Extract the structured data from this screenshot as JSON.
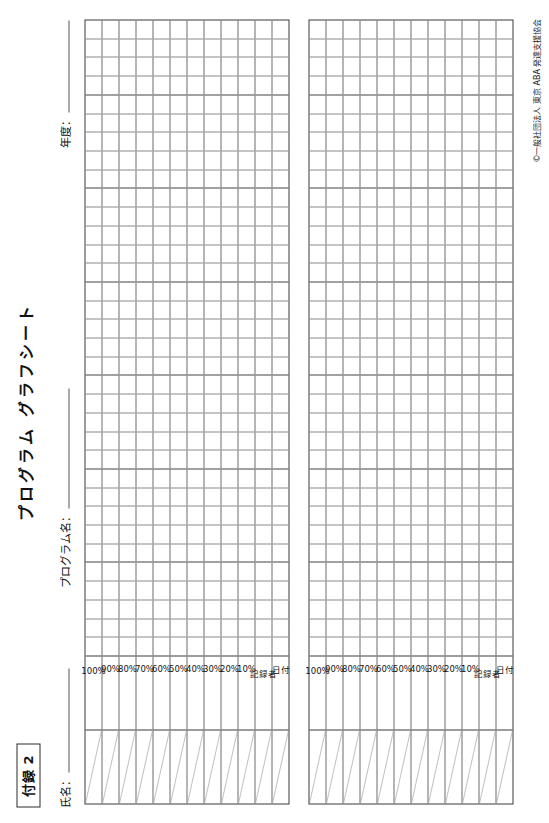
{
  "document": {
    "appendix_label": "付録 2",
    "title": "プログラム グラフシート",
    "copyright": "©一般社団法人 東京 ABA 発達支援協会"
  },
  "fields": {
    "name_label": "氏名：",
    "name_value": "",
    "program_label": "プログラム名：",
    "program_value": "",
    "year_label": "年度：",
    "year_value": ""
  },
  "chart_data": {
    "type": "table",
    "title": "プログラム グラフシート",
    "xlabel": "",
    "ylabel": "",
    "grid": true,
    "legend": "none",
    "charts": [
      {
        "id": "chart-1",
        "row_labels": [
          "100%",
          "90%",
          "80%",
          "70%",
          "60%",
          "50%",
          "40%",
          "30%",
          "20%",
          "10%",
          "記録者",
          "日付"
        ],
        "header_rows": 12,
        "columns": 34,
        "values": [],
        "ylim": [
          0,
          100
        ],
        "ytick_labels": [
          "100%",
          "90%",
          "80%",
          "70%",
          "60%",
          "50%",
          "40%",
          "30%",
          "20%",
          "10%"
        ],
        "extra_rows": [
          "記録者",
          "日付"
        ]
      },
      {
        "id": "chart-2",
        "row_labels": [
          "100%",
          "90%",
          "80%",
          "70%",
          "60%",
          "50%",
          "40%",
          "30%",
          "20%",
          "10%",
          "記録者",
          "日付"
        ],
        "header_rows": 12,
        "columns": 34,
        "values": [],
        "ylim": [
          0,
          100
        ],
        "ytick_labels": [
          "100%",
          "90%",
          "80%",
          "70%",
          "60%",
          "50%",
          "40%",
          "30%",
          "20%",
          "10%"
        ],
        "extra_rows": [
          "記録者",
          "日付"
        ]
      }
    ]
  },
  "colors": {
    "ink": "#111111",
    "grid_light": "#8a8a8a",
    "grid_mid": "#6d6d6d",
    "border": "#3a3a3a",
    "paper": "#ffffff"
  }
}
